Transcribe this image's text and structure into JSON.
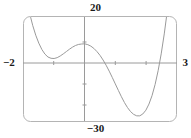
{
  "figure": {
    "kind": "graphing-calculator-plot",
    "background_color": "#ffffff",
    "curve_color": "#9a9a9a",
    "axis_color": "#9a9a9a",
    "frame_color": "#b4b4b4",
    "label_color": "#1a1a1a"
  },
  "labels": {
    "y_max": "20",
    "y_min": "−30",
    "x_min": "−2",
    "x_max": "3"
  },
  "chart_data": {
    "type": "line",
    "title": "",
    "xlabel": "",
    "ylabel": "",
    "xlim": [
      -2,
      3
    ],
    "ylim": [
      -30,
      20
    ],
    "grid": false,
    "legend": null,
    "axes": {
      "x_axis_at_y": 0,
      "y_axis_at_x": 0,
      "x_tick_spacing": 1,
      "y_tick_spacing": 10,
      "x_ticks": [
        -1,
        1,
        2
      ],
      "y_ticks": [
        -20,
        -10,
        10
      ]
    },
    "series": [
      {
        "name": "f(x)",
        "x": [
          -2.0,
          -1.9,
          -1.8,
          -1.7,
          -1.6,
          -1.5,
          -1.4,
          -1.3,
          -1.2,
          -1.1,
          -1.0,
          -0.9,
          -0.8,
          -0.7,
          -0.6,
          -0.5,
          -0.4,
          -0.3,
          -0.2,
          -0.1,
          0.0,
          0.1,
          0.2,
          0.3,
          0.4,
          0.5,
          0.6,
          0.7,
          0.8,
          0.9,
          1.0,
          1.1,
          1.2,
          1.3,
          1.4,
          1.5,
          1.6,
          1.7,
          1.8,
          1.9,
          2.0,
          2.1,
          2.2,
          2.3,
          2.4,
          2.5,
          2.6,
          2.7,
          2.8,
          2.9,
          3.0
        ],
        "y": [
          36.0,
          28.2,
          21.5,
          15.8,
          11.1,
          7.3,
          4.3,
          2.1,
          0.7,
          0.1,
          0.0,
          0.4,
          1.2,
          2.2,
          3.3,
          4.4,
          5.4,
          6.2,
          6.7,
          6.9,
          7.0,
          6.6,
          5.9,
          4.8,
          3.3,
          1.5,
          -0.7,
          -3.2,
          -6.0,
          -9.0,
          -12.1,
          -15.2,
          -18.2,
          -21.0,
          -23.4,
          -25.3,
          -26.6,
          -27.3,
          -27.3,
          -26.4,
          -24.6,
          -21.7,
          -17.7,
          -12.4,
          -5.8,
          2.2,
          11.7,
          22.8,
          35.6,
          50.2,
          66.6
        ]
      }
    ],
    "features": {
      "local_minimum_left": {
        "x": -1.0,
        "y": 0.0
      },
      "local_maximum": {
        "x": 0.0,
        "y": 7.0
      },
      "local_minimum_right": {
        "x": 1.85,
        "y": -27.4
      },
      "x_intercepts": [
        -1.0,
        0.55,
        2.43
      ]
    }
  }
}
